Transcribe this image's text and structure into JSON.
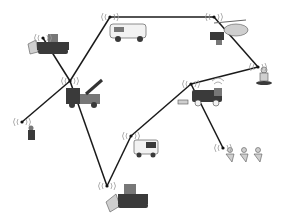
{
  "diagram": {
    "type": "emergency-responder-wireless-mesh-network",
    "nodes": [
      {
        "id": "bulldozer-top",
        "icon": "bulldozer-icon",
        "x": 43,
        "y": 38
      },
      {
        "id": "van",
        "icon": "van-icon",
        "x": 110,
        "y": 17
      },
      {
        "id": "helicopter-medevac",
        "icon": "helicopter-icon",
        "x": 214,
        "y": 17
      },
      {
        "id": "rescuer",
        "icon": "rescuer-person-icon",
        "x": 258,
        "y": 67
      },
      {
        "id": "crane-truck",
        "icon": "crane-truck-icon",
        "x": 70,
        "y": 81
      },
      {
        "id": "fire-truck",
        "icon": "fire-truck-icon",
        "x": 191,
        "y": 84
      },
      {
        "id": "walker",
        "icon": "walking-person-icon",
        "x": 22,
        "y": 122
      },
      {
        "id": "ambulance",
        "icon": "ambulance-icon",
        "x": 131,
        "y": 136
      },
      {
        "id": "runners",
        "icon": "running-people-icon",
        "x": 223,
        "y": 148
      },
      {
        "id": "bulldozer-bottom",
        "icon": "bulldozer-icon",
        "x": 107,
        "y": 186
      }
    ],
    "edges": [
      [
        "walker",
        "crane-truck"
      ],
      [
        "crane-truck",
        "van"
      ],
      [
        "van",
        "helicopter-medevac"
      ],
      [
        "helicopter-medevac",
        "rescuer"
      ],
      [
        "rescuer",
        "fire-truck"
      ],
      [
        "fire-truck",
        "ambulance"
      ],
      [
        "fire-truck",
        "runners"
      ],
      [
        "ambulance",
        "bulldozer-bottom"
      ],
      [
        "bulldozer-bottom",
        "crane-truck"
      ],
      [
        "crane-truck",
        "bulldozer-top"
      ]
    ],
    "colors": {
      "line": "#1a1a1a",
      "signal": "#9a9a9a",
      "background": "#ffffff"
    }
  }
}
